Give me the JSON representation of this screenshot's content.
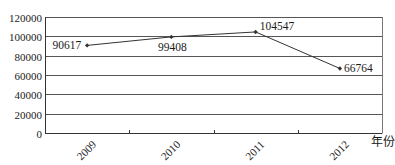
{
  "chart_data": {
    "type": "line",
    "title": "",
    "xlabel": "年份",
    "ylabel": "",
    "categories": [
      "2009",
      "2010",
      "2011",
      "2012"
    ],
    "series": [
      {
        "name": "",
        "values": [
          90617,
          99408,
          104547,
          66764
        ],
        "data_labels": [
          "90617",
          "99408",
          "104547",
          "66764"
        ]
      }
    ],
    "ylim": [
      0,
      120000
    ],
    "y_ticks": [
      0,
      20000,
      40000,
      60000,
      80000,
      100000,
      120000
    ],
    "y_tick_labels": [
      "0",
      "20000",
      "40000",
      "60000",
      "80000",
      "100000",
      "120000"
    ],
    "grid": true,
    "legend": "none",
    "x_tick_label_rotation": -45,
    "colors": {
      "line": "#333333",
      "grid": "#555555",
      "axis": "#333333"
    }
  }
}
